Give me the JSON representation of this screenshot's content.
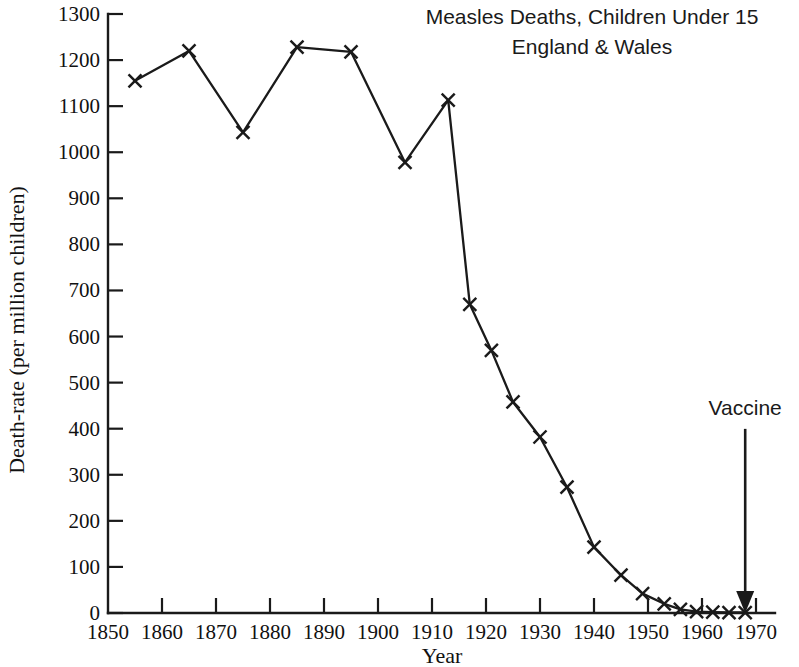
{
  "chart_data": {
    "type": "line",
    "title": "Measles Deaths, Children Under 15",
    "subtitle": "England & Wales",
    "xlabel": "Year",
    "ylabel": "Death-rate (per million children)",
    "xlim": [
      1850,
      1970
    ],
    "ylim": [
      0,
      1300
    ],
    "grid": false,
    "legend": null,
    "marker": "x",
    "x_ticks": [
      1850,
      1860,
      1870,
      1880,
      1890,
      1900,
      1910,
      1920,
      1930,
      1940,
      1950,
      1960,
      1970
    ],
    "x_tick_labels": [
      "1850",
      "1860",
      "1870",
      "1880",
      "1890",
      "1900",
      "1910",
      "1920",
      "1930",
      "1940",
      "1950",
      "1960",
      "1970"
    ],
    "y_ticks": [
      0,
      100,
      200,
      300,
      400,
      500,
      600,
      700,
      800,
      900,
      1000,
      1100,
      1200,
      1300
    ],
    "y_tick_labels": [
      "0",
      "100",
      "200",
      "300",
      "400",
      "500",
      "600",
      "700",
      "800",
      "900",
      "1000",
      "1100",
      "1200",
      "1300"
    ],
    "series": [
      {
        "name": "Measles death-rate",
        "x": [
          1855,
          1865,
          1875,
          1885,
          1895,
          1905,
          1913,
          1917,
          1921,
          1925,
          1930,
          1935,
          1940,
          1945,
          1949,
          1953,
          1956,
          1959,
          1962,
          1965,
          1968
        ],
        "values": [
          1155,
          1220,
          1043,
          1228,
          1218,
          978,
          1113,
          670,
          570,
          458,
          382,
          273,
          143,
          82,
          42,
          20,
          8,
          3,
          2,
          1,
          1
        ]
      }
    ],
    "annotations": [
      {
        "label": "Vaccine",
        "x": 1968,
        "y": 0,
        "label_x": 1968,
        "label_y": 430,
        "arrow": "down"
      }
    ]
  }
}
